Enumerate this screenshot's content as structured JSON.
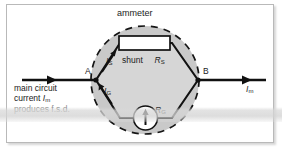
{
  "figure": {
    "title": "ammeter",
    "terminals": {
      "left_label": "A",
      "right_label": "B"
    },
    "components": {
      "shunt_label": "shunt",
      "shunt_resistance": "R",
      "shunt_resistance_subscript": "S",
      "galvanometer_resistance": "R",
      "galvanometer_resistance_subscript": "G",
      "galvanometer_icon": "meter-up-arrow-icon"
    },
    "currents": {
      "shunt_branch": "I",
      "shunt_branch_subscript": "S",
      "galvanometer_branch": "I",
      "galvanometer_branch_subscript": "G",
      "main_right": "I",
      "main_right_subscript": "m"
    },
    "caption": {
      "line1": "main circuit",
      "line2_text": "current ",
      "line2_symbol": "I",
      "line2_subscript": "m",
      "line3": "produces f.s.d."
    },
    "colors": {
      "ink": "#1b1b1b",
      "hexagon_fill": "#d4d4d4",
      "ammeter_disc_fill": "#c9c9c9",
      "shunt_box_fill": "#ffffff",
      "frame_border": "#b9b9b9",
      "page_background": "#ffffff"
    },
    "geometry": {
      "dashed_circle_center_x": 145,
      "dashed_circle_center_y": 80,
      "dashed_circle_radius": 55,
      "hexagon_left_vertex_x": 96,
      "hexagon_right_vertex_x": 198
    }
  }
}
